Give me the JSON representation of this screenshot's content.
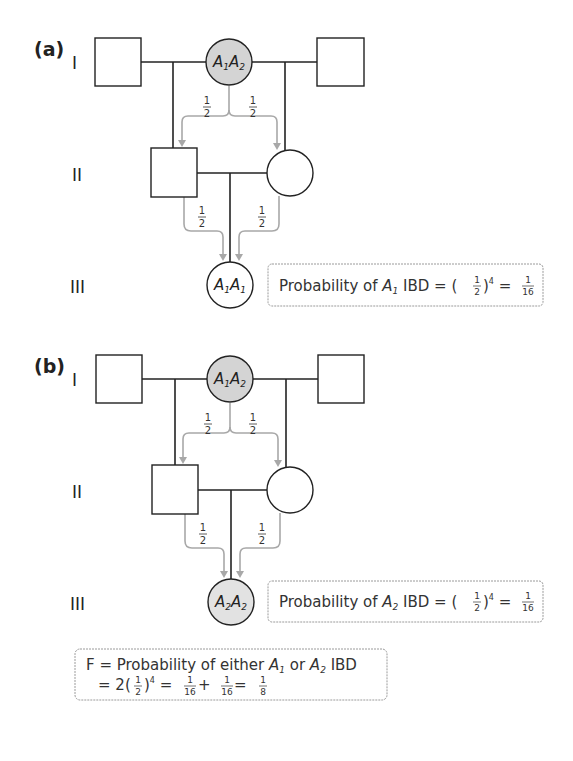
{
  "panels": [
    {
      "label": "(a)",
      "generations": [
        "I",
        "II",
        "III"
      ],
      "gen_I": {
        "mother_genotype": {
          "a": "A",
          "a_sub": "1",
          "b": "A",
          "b_sub": "2"
        }
      },
      "gen_III": {
        "child_genotype": {
          "a": "A",
          "a_sub": "1",
          "b": "A",
          "b_sub": "1"
        }
      },
      "fractions": {
        "num": "1",
        "den": "2"
      },
      "result_box": {
        "prefix": "Probability of ",
        "allele": "A",
        "allele_sub": "1",
        "middle": " IBD = (",
        "frac_num": "1",
        "frac_den": "2",
        "exp": "4",
        "eq": " = ",
        "res_num": "1",
        "res_den": "16"
      }
    },
    {
      "label": "(b)",
      "generations": [
        "I",
        "II",
        "III"
      ],
      "gen_I": {
        "mother_genotype": {
          "a": "A",
          "a_sub": "1",
          "b": "A",
          "b_sub": "2"
        }
      },
      "gen_III": {
        "child_genotype": {
          "a": "A",
          "a_sub": "2",
          "b": "A",
          "b_sub": "2"
        }
      },
      "fractions": {
        "num": "1",
        "den": "2"
      },
      "result_box": {
        "prefix": "Probability of ",
        "allele": "A",
        "allele_sub": "2",
        "middle": " IBD = (",
        "frac_num": "1",
        "frac_den": "2",
        "exp": "4",
        "eq": " = ",
        "res_num": "1",
        "res_den": "16"
      }
    }
  ],
  "summary_box": {
    "line1_prefix": "F = Probability of either ",
    "a1": "A",
    "a1_sub": "1",
    "or": " or ",
    "a2": "A",
    "a2_sub": "2",
    "line1_suffix": " IBD",
    "line2_prefix": "= 2(",
    "frac_num": "1",
    "frac_den": "2",
    "exp": "4",
    "eq1": " = ",
    "t1_num": "1",
    "t1_den": "16",
    "plus": " + ",
    "t2_num": "1",
    "t2_den": "16",
    "eq2": " = ",
    "res_num": "1",
    "res_den": "8"
  },
  "colors": {
    "affected_fill": "#d4d4d4",
    "arrow": "#a8a8a8",
    "line": "#222222",
    "box_border": "#9a9a9a"
  }
}
